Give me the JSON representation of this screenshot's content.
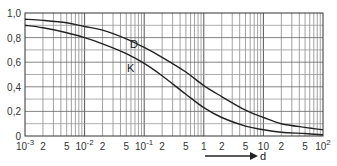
{
  "chart_data": {
    "type": "line",
    "title": "",
    "xlabel": "d",
    "ylabel": "",
    "xscale": "log",
    "xlim": [
      0.001,
      100
    ],
    "ylim": [
      0,
      1.0
    ],
    "grid": true,
    "legend": "inline labels",
    "x_tick_labels": [
      "10^-3",
      "2",
      "5",
      "10^-2",
      "2",
      "5",
      "10^-1",
      "2",
      "5",
      "1",
      "2",
      "5",
      "10",
      "2",
      "5",
      "10^2"
    ],
    "y_tick_labels": [
      "0",
      "0.2",
      "0.4",
      "0.6",
      "0.8",
      "1.0"
    ],
    "x": [
      0.001,
      0.002,
      0.005,
      0.01,
      0.02,
      0.05,
      0.1,
      0.2,
      0.5,
      1,
      2,
      5,
      10,
      20,
      50,
      100
    ],
    "series": [
      {
        "name": "D",
        "values": [
          0.95,
          0.94,
          0.92,
          0.89,
          0.86,
          0.79,
          0.72,
          0.64,
          0.52,
          0.41,
          0.32,
          0.21,
          0.15,
          0.1,
          0.07,
          0.05
        ]
      },
      {
        "name": "K",
        "values": [
          0.9,
          0.88,
          0.84,
          0.8,
          0.75,
          0.67,
          0.59,
          0.49,
          0.34,
          0.23,
          0.15,
          0.08,
          0.05,
          0.03,
          0.02,
          0.01
        ]
      }
    ],
    "annotations": [
      {
        "text": "D",
        "x": 0.13,
        "y": 0.79
      },
      {
        "text": "K",
        "x": 0.11,
        "y": 0.58
      }
    ]
  },
  "labels": {
    "y": [
      "0",
      "0,2",
      "0,4",
      "0,6",
      "0,8",
      "1,0"
    ],
    "x_axis": "d",
    "curve_d": "D",
    "curve_k": "K"
  }
}
